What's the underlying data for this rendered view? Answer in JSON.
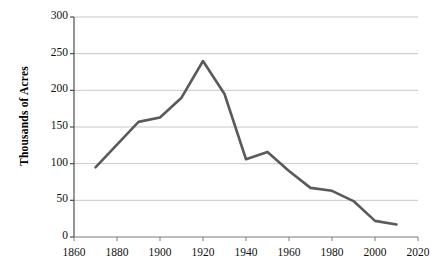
{
  "chart_data": {
    "type": "line",
    "title": "",
    "xlabel": "",
    "ylabel": "Thousands of Acres",
    "x": [
      1870,
      1880,
      1890,
      1900,
      1910,
      1920,
      1930,
      1940,
      1950,
      1960,
      1970,
      1980,
      1990,
      2000,
      2010
    ],
    "values": [
      95,
      126,
      157,
      163,
      190,
      240,
      195,
      106,
      116,
      90,
      67,
      63,
      49,
      22,
      17
    ],
    "series": [
      {
        "name": "Acres",
        "values": [
          95,
          126,
          157,
          163,
          190,
          240,
          195,
          106,
          116,
          90,
          67,
          63,
          49,
          22,
          17
        ]
      }
    ],
    "xlim": [
      1860,
      2020
    ],
    "ylim": [
      0,
      300
    ],
    "xticks": [
      1860,
      1880,
      1900,
      1920,
      1940,
      1960,
      1980,
      2000,
      2020
    ],
    "yticks": [
      0,
      50,
      100,
      150,
      200,
      250,
      300
    ],
    "xtick_labels": [
      "1860",
      "1880",
      "1900",
      "1920",
      "1940",
      "1960",
      "1980",
      "2000",
      "2020"
    ],
    "ytick_labels": [
      "0",
      "50",
      "100",
      "150",
      "200",
      "250",
      "300"
    ],
    "grid": "horizontal",
    "legend": "none",
    "line_color": "#5a5a5a",
    "grid_color": "#c8c8c8",
    "axis_color": "#7a7a7a",
    "background": "#ffffff"
  }
}
